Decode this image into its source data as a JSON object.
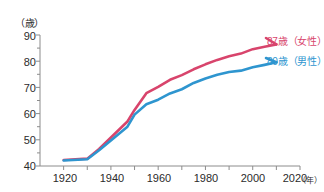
{
  "chart_data": {
    "type": "line",
    "title": "",
    "subtitle": "",
    "xlabel": "(年)",
    "ylabel": "(歳)",
    "x_unit_label": "(年)",
    "y_unit_label": "(歳)",
    "xlim": [
      1910,
      2020
    ],
    "ylim": [
      40,
      90
    ],
    "x_ticks": [
      1920,
      1940,
      1960,
      1980,
      2000,
      2020
    ],
    "x_tick_labels": [
      "1920",
      "1940",
      "1960",
      "1980",
      "2000",
      "2020"
    ],
    "x_minor_tick_step": 10,
    "y_ticks": [
      40,
      50,
      60,
      70,
      80,
      90
    ],
    "y_tick_labels": [
      "40",
      "50",
      "60",
      "70",
      "80",
      "90"
    ],
    "y_minor_tick_step": 5,
    "grid": false,
    "legend_position": "right-inside-end-of-line",
    "series": [
      {
        "name": "87歳(女性)",
        "label": "87歳（女性）",
        "color": "#d8446c",
        "end_value_label": "87",
        "x": [
          1920,
          1930,
          1935,
          1947,
          1950,
          1955,
          1960,
          1965,
          1970,
          1975,
          1980,
          1985,
          1990,
          1995,
          2000,
          2005,
          2010
        ],
        "values": [
          42.3,
          42.8,
          46.5,
          57.0,
          61.4,
          67.8,
          70.2,
          72.9,
          74.7,
          76.9,
          78.8,
          80.5,
          81.9,
          82.9,
          84.6,
          85.5,
          86.4
        ]
      },
      {
        "name": "80歳(男性)",
        "label": "80歳（男性）",
        "color": "#2e95cf",
        "end_value_label": "80",
        "x": [
          1920,
          1930,
          1935,
          1947,
          1950,
          1955,
          1960,
          1965,
          1970,
          1975,
          1980,
          1985,
          1990,
          1995,
          2000,
          2005,
          2010
        ],
        "values": [
          42.1,
          42.6,
          46.0,
          55.0,
          59.6,
          63.6,
          65.3,
          67.7,
          69.3,
          71.7,
          73.4,
          74.8,
          75.9,
          76.4,
          77.7,
          78.6,
          79.6
        ]
      }
    ]
  },
  "axes": {
    "unit_y": "（歳）",
    "unit_x": "（年）",
    "y_tick_labels": [
      "90",
      "80",
      "70",
      "60",
      "50",
      "40"
    ],
    "x_tick_labels": [
      "1920",
      "1940",
      "1960",
      "1980",
      "2000",
      "2020"
    ]
  },
  "legend": {
    "female_label": "87歳（女性）",
    "male_label": "80歳（男性）",
    "female_color": "#d8446c",
    "male_color": "#2e95cf"
  }
}
